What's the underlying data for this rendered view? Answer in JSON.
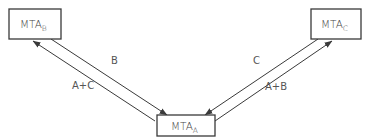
{
  "diagram": {
    "nodes": {
      "mta_b": {
        "base": "MTA",
        "subscript": "B"
      },
      "mta_c": {
        "base": "MTA",
        "subscript": "C"
      },
      "mta_a": {
        "base": "MTA",
        "subscript": "A"
      }
    },
    "edges": [
      {
        "from": "MTA_A",
        "to": "MTA_B",
        "label": "A+C"
      },
      {
        "from": "MTA_B",
        "to": "MTA_A",
        "label": "B"
      },
      {
        "from": "MTA_C",
        "to": "MTA_A",
        "label": "C"
      },
      {
        "from": "MTA_A",
        "to": "MTA_C",
        "label": "A+B"
      }
    ],
    "colors": {
      "stroke": "#3a3a3a",
      "text": "#444444"
    }
  }
}
